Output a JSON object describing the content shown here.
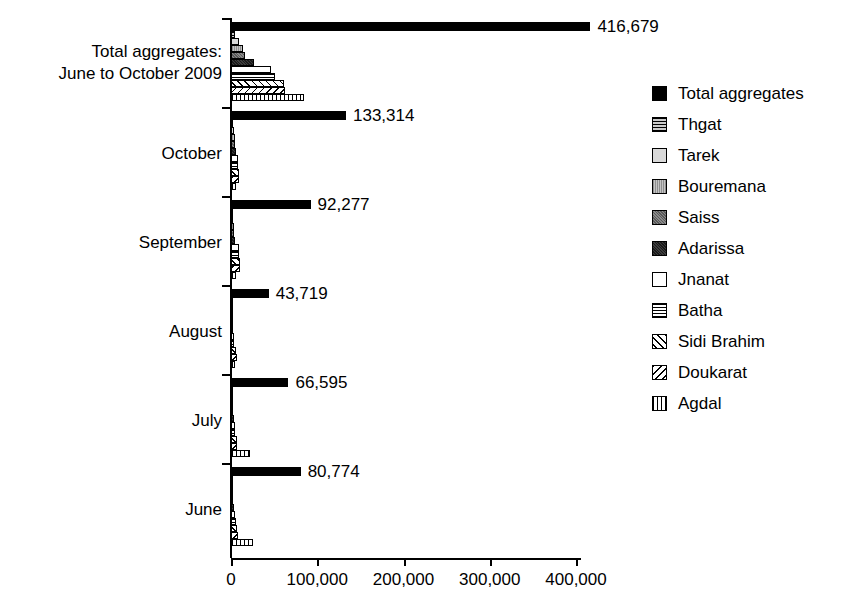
{
  "chart_data": {
    "type": "bar",
    "orientation": "horizontal",
    "title": "",
    "xlabel": "",
    "ylabel": "",
    "xlim": [
      0,
      450000
    ],
    "grid": false,
    "legend_position": "right",
    "xticks": [
      {
        "value": 0,
        "label": "0"
      },
      {
        "value": 100000,
        "label": "100,000"
      },
      {
        "value": 200000,
        "label": "200,000"
      },
      {
        "value": 300000,
        "label": "300,000"
      },
      {
        "value": 400000,
        "label": "400,000"
      }
    ],
    "categories": [
      "Total aggregates:\nJune to October 2009",
      "October",
      "September",
      "August",
      "July",
      "June"
    ],
    "series": [
      {
        "name": "Total aggregates",
        "pattern": "total",
        "values": [
          416679,
          133314,
          92277,
          43719,
          66595,
          80774
        ]
      },
      {
        "name": "Thgat",
        "pattern": "thgat",
        "values": [
          4200,
          1500,
          900,
          600,
          700,
          800
        ]
      },
      {
        "name": "Tarek",
        "pattern": "tarek",
        "values": [
          9500,
          3200,
          2100,
          1200,
          1500,
          1700
        ]
      },
      {
        "name": "Bouremana",
        "pattern": "bouremana",
        "values": [
          13500,
          4200,
          3100,
          1600,
          2000,
          2300
        ]
      },
      {
        "name": "Saiss",
        "pattern": "saiss",
        "values": [
          16500,
          4800,
          3600,
          1900,
          2400,
          2800
        ]
      },
      {
        "name": "Adarissa",
        "pattern": "adarissa",
        "values": [
          27000,
          6100,
          5000,
          2400,
          3000,
          3600
        ]
      },
      {
        "name": "Jnanat",
        "pattern": "jnanat",
        "values": [
          46000,
          7800,
          9000,
          3600,
          4300,
          5000
        ]
      },
      {
        "name": "Batha",
        "pattern": "batha",
        "values": [
          51000,
          8200,
          9600,
          3900,
          4700,
          5500
        ]
      },
      {
        "name": "Sidi Brahim",
        "pattern": "sidibrahim",
        "values": [
          62000,
          9200,
          10500,
          6200,
          6800,
          7500
        ]
      },
      {
        "name": "Doukarat",
        "pattern": "doukarat",
        "values": [
          63000,
          9600,
          10800,
          6600,
          7200,
          7900
        ]
      },
      {
        "name": "Agdal",
        "pattern": "agdal",
        "values": [
          85000,
          6200,
          5600,
          4200,
          22000,
          25000
        ]
      }
    ],
    "value_labels": [
      "416,679",
      "133,314",
      "92,277",
      "43,719",
      "66,595",
      "80,774"
    ]
  }
}
